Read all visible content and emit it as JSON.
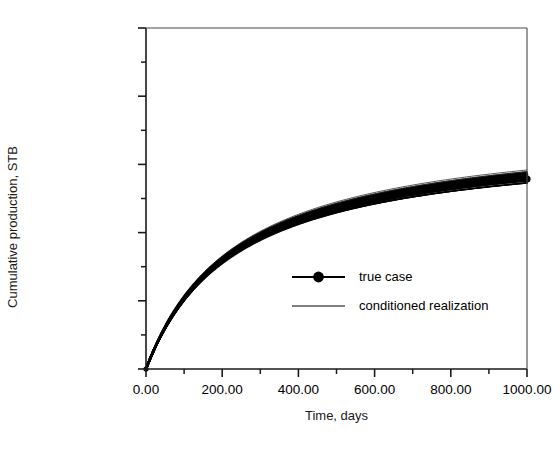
{
  "chart_data": {
    "type": "line",
    "title": "",
    "xlabel": "Time, days",
    "ylabel": "Cumulative production, STB",
    "xlim": [
      0,
      1000
    ],
    "ylim": [
      0,
      10000000
    ],
    "xticks": [
      0,
      200,
      400,
      600,
      800,
      1000
    ],
    "xticklabels": [
      "0.00",
      "200.00",
      "400.00",
      "600.00",
      "800.00",
      "1000.00"
    ],
    "xminor_step": 100,
    "yticks": [
      0,
      2000000,
      4000000,
      6000000,
      8000000,
      10000000
    ],
    "yticklabels": [
      "0.00E+0",
      "2.00E+6",
      "4.00E+6",
      "6.00E+6",
      "8.00E+6",
      "1.00E+7"
    ],
    "yminor_step": 1000000,
    "grid": false,
    "legend_position": "center-right-inside",
    "legend": [
      {
        "label": "true case",
        "style": "line-with-filled-circle-marker",
        "color": "#000000"
      },
      {
        "label": "conditioned realization",
        "style": "thin-line",
        "color": "#000000"
      }
    ],
    "series": [
      {
        "name": "true case",
        "style": "line-with-filled-circle-marker",
        "color": "#000000",
        "x": [
          0,
          25,
          50,
          75,
          100,
          150,
          200,
          250,
          300,
          350,
          400,
          450,
          500,
          600,
          700,
          800,
          900,
          1000
        ],
        "y": [
          0,
          620000,
          1150000,
          1600000,
          2000000,
          2650000,
          3180000,
          3600000,
          3950000,
          4230000,
          4450000,
          4640000,
          4800000,
          5050000,
          5230000,
          5370000,
          5480000,
          5570000
        ]
      },
      {
        "name": "conditioned realization envelope lower",
        "style": "thin-line",
        "color": "#000000",
        "x": [
          0,
          25,
          50,
          75,
          100,
          150,
          200,
          250,
          300,
          350,
          400,
          450,
          500,
          600,
          700,
          800,
          900,
          1000
        ],
        "y": [
          0,
          560000,
          1060000,
          1490000,
          1870000,
          2490000,
          2990000,
          3390000,
          3720000,
          3990000,
          4210000,
          4390000,
          4540000,
          4790000,
          4980000,
          5120000,
          5240000,
          5340000
        ]
      },
      {
        "name": "conditioned realization envelope upper",
        "style": "thin-line",
        "color": "#000000",
        "x": [
          0,
          25,
          50,
          75,
          100,
          150,
          200,
          250,
          300,
          350,
          400,
          450,
          500,
          600,
          700,
          800,
          900,
          1000
        ],
        "y": [
          0,
          680000,
          1250000,
          1730000,
          2140000,
          2820000,
          3370000,
          3800000,
          4160000,
          4450000,
          4690000,
          4890000,
          5060000,
          5330000,
          5540000,
          5700000,
          5830000,
          5950000
        ]
      }
    ],
    "realization_count": 30
  },
  "axes": {
    "y_axis_title": "Cumulative production, STB",
    "x_axis_title": "Time, days"
  },
  "legend_items": {
    "true_case": "true case",
    "conditioned_realization": "conditioned realization"
  }
}
